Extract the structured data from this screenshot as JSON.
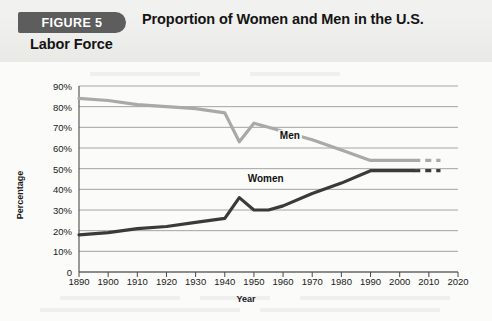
{
  "header": {
    "figure_tab": "FIGURE 5",
    "title_line1": "Proportion of Women and Men in the U.S.",
    "title_line2": "Labor Force"
  },
  "colors": {
    "men_line": "#a9a9a9",
    "women_line": "#3a3a3a",
    "tab_background": "#5d5d5d",
    "header_background": "#eeeeec",
    "gridline": "#9a9a9a",
    "axis": "#4a4a4a"
  },
  "chart_data": {
    "type": "line",
    "title": "Proportion of Women and Men in the U.S. Labor Force",
    "xlabel": "Year",
    "ylabel": "Percentage",
    "xlim": [
      1890,
      2020
    ],
    "ylim": [
      0,
      90
    ],
    "xticks": [
      1890,
      1900,
      1910,
      1920,
      1930,
      1940,
      1950,
      1960,
      1970,
      1980,
      1990,
      2000,
      2010,
      2020
    ],
    "yticks": [
      0,
      10,
      20,
      30,
      40,
      50,
      60,
      70,
      80,
      90
    ],
    "ytick_labels": [
      "0",
      "10%",
      "20%",
      "30%",
      "40%",
      "50%",
      "60%",
      "70%",
      "80%",
      "90%"
    ],
    "grid": true,
    "legend": "inline-labels",
    "series": [
      {
        "name": "Men",
        "color": "#a9a9a9",
        "label_x": 1963,
        "label_y": 66,
        "x": [
          1890,
          1900,
          1910,
          1920,
          1930,
          1940,
          1945,
          1950,
          1955,
          1960,
          1970,
          1980,
          1990,
          2000,
          2005
        ],
        "values": [
          84,
          83,
          81,
          80,
          79,
          77,
          63,
          72,
          70,
          68,
          64,
          59,
          54,
          54,
          54
        ],
        "projection": {
          "x": [
            2008,
            2014
          ],
          "values": [
            54,
            54
          ],
          "style": "dashed"
        }
      },
      {
        "name": "Women",
        "color": "#3a3a3a",
        "label_x": 1952,
        "label_y": 45,
        "x": [
          1890,
          1900,
          1910,
          1920,
          1930,
          1940,
          1945,
          1950,
          1955,
          1960,
          1970,
          1980,
          1990,
          2000,
          2005
        ],
        "values": [
          18,
          19,
          21,
          22,
          24,
          26,
          36,
          30,
          30,
          32,
          38,
          43,
          49,
          49,
          49
        ],
        "projection": {
          "x": [
            2008,
            2014
          ],
          "values": [
            49,
            49
          ],
          "style": "dashed"
        }
      }
    ]
  }
}
